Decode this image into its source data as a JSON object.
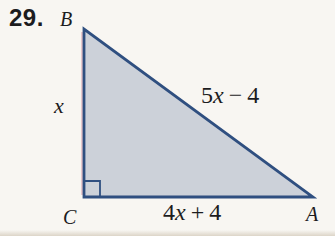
{
  "problem_number": "29.",
  "vertices": {
    "top": "B",
    "bottom_left": "C",
    "bottom_right": "A"
  },
  "sides": {
    "left": {
      "variable": "x"
    },
    "hypotenuse": {
      "coef": "5",
      "variable": "x",
      "operator": "−",
      "constant": "4"
    },
    "bottom": {
      "coef": "4",
      "variable": "x",
      "operator": "+",
      "constant": "4"
    }
  },
  "right_angle_vertex": "C",
  "colors": {
    "background": "#f8f6f2",
    "triangle_fill": "#ccd1d9",
    "triangle_stroke": "#2f4f80",
    "text": "#1c1c1e",
    "print_fringe": "#c0506a",
    "bottom_shadow": "#d9d1c3"
  }
}
